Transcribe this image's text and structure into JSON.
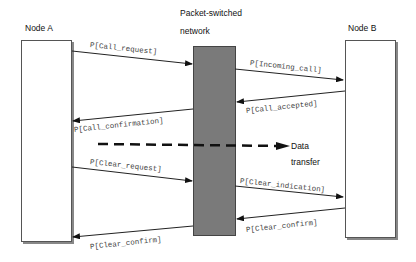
{
  "nodes": {
    "node_a": "Node A",
    "node_b": "Node B",
    "network_line1": "Packet-switched",
    "network_line2": "network"
  },
  "messages": [
    {
      "label": "P[Call_request]",
      "direction": "A->network"
    },
    {
      "label": "P[Incoming_call]",
      "direction": "network->B"
    },
    {
      "label": "P[Call_accepted]",
      "direction": "B->network"
    },
    {
      "label": "P[Call_confirmation]",
      "direction": "network->A"
    },
    {
      "label": "P[Clear_request]",
      "direction": "A->network"
    },
    {
      "label": "P[Clear_indication]",
      "direction": "network->B"
    },
    {
      "label": "P[Clear_confirm]",
      "direction": "B->network"
    },
    {
      "label": "P[Clear_confirm]",
      "direction": "network->A"
    }
  ],
  "data_transfer": {
    "line1": "Data",
    "line2": "transfer"
  }
}
